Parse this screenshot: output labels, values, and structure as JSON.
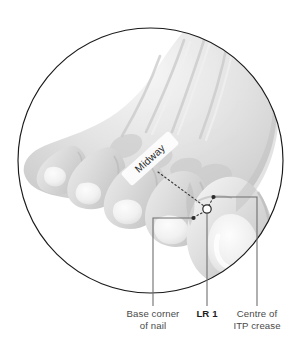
{
  "figure": {
    "frame_shape": "circle",
    "colors": {
      "background": "#ffffff",
      "frame_stroke": "#1a1a1a",
      "skin_light": "#f2f2f2",
      "skin_mid": "#d8d8d8",
      "skin_shadow": "#bdbdbd",
      "nail_highlight": "#fbfbfb",
      "leader_line": "#6f6f6f",
      "dotted_line": "#3a3a3a",
      "point_fill": "#ffffff",
      "point_stroke": "#2b2b2b",
      "caption_text": "#4a4a4a",
      "caption_bold_text": "#1d1d1d"
    }
  },
  "annotations": {
    "midway": {
      "label": "Midway",
      "rotation_deg": -42
    },
    "point_marker": {
      "name": "LR 1",
      "shape": "open-circle",
      "x": 207,
      "y": 209,
      "radius": 4.2
    },
    "dot_markers": [
      {
        "name": "base-corner-of-nail-dot",
        "x": 193,
        "y": 218
      },
      {
        "name": "centre-of-itp-crease-dot",
        "x": 213,
        "y": 197
      }
    ]
  },
  "captions": [
    {
      "id": "base-corner-of-nail",
      "line1": "Base corner",
      "line2": "of nail",
      "bold": false,
      "leader_x": 153
    },
    {
      "id": "lr-1",
      "line1": "LR 1",
      "line2": "",
      "bold": true,
      "leader_x": 207
    },
    {
      "id": "centre-of-itp-crease",
      "line1": "Centre of",
      "line2": "ITP crease",
      "bold": false,
      "leader_x": 257
    }
  ]
}
